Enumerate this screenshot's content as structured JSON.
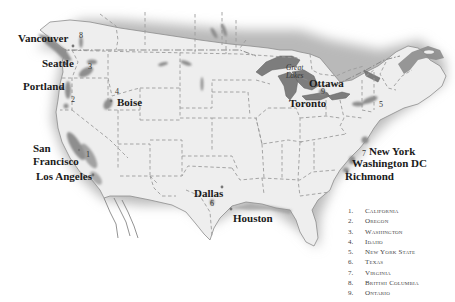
{
  "map": {
    "title": "Map of wine regions / cities of North America",
    "colors": {
      "land": "#efefef",
      "region": "#8a8a8a",
      "water": "#7a7a7a",
      "border": "#9a9a9a",
      "shadow": "#bdbdbd"
    }
  },
  "cities": [
    {
      "name": "Vancouver",
      "x": 18,
      "y": 35
    },
    {
      "name": "Seattle",
      "x": 42,
      "y": 60
    },
    {
      "name": "Portland",
      "x": 23,
      "y": 82
    },
    {
      "name": "Boise",
      "x": 117,
      "y": 97
    },
    {
      "name": "San Francisco",
      "line1": "San",
      "line2": "Francisco",
      "x": 33,
      "y": 142
    },
    {
      "name": "Los Angeles",
      "x": 36,
      "y": 171
    },
    {
      "name": "Dallas",
      "x": 194,
      "y": 189
    },
    {
      "name": "Houston",
      "x": 233,
      "y": 214
    },
    {
      "name": "Ottawa",
      "x": 308,
      "y": 78
    },
    {
      "name": "Toronto",
      "x": 288,
      "y": 98
    },
    {
      "name": "New York",
      "x": 369,
      "y": 146
    },
    {
      "name": "Washington DC",
      "x": 352,
      "y": 158
    },
    {
      "name": "Richmond",
      "x": 345,
      "y": 171
    }
  ],
  "region_numbers": [
    {
      "label": "1",
      "x": 86,
      "y": 151
    },
    {
      "label": "2",
      "x": 71,
      "y": 96
    },
    {
      "label": "3",
      "x": 88,
      "y": 64
    },
    {
      "label": "4",
      "x": 115,
      "y": 88
    },
    {
      "label": "5",
      "x": 379,
      "y": 101
    },
    {
      "label": "6",
      "x": 210,
      "y": 200
    },
    {
      "label": "7",
      "x": 362,
      "y": 150
    },
    {
      "label": "8",
      "x": 79,
      "y": 33
    },
    {
      "label": "9",
      "x": 321,
      "y": 89
    }
  ],
  "lake_label": {
    "line1": "Great",
    "line2": "Lakes",
    "x": 286,
    "y": 64
  },
  "legend": {
    "items": [
      {
        "num": "1.",
        "name": "California"
      },
      {
        "num": "2.",
        "name": "Oregon"
      },
      {
        "num": "3.",
        "name": "Washington"
      },
      {
        "num": "4.",
        "name": "Idaho"
      },
      {
        "num": "5.",
        "name": "New York State"
      },
      {
        "num": "6.",
        "name": "Texas"
      },
      {
        "num": "7.",
        "name": "Virginia"
      },
      {
        "num": "8.",
        "name": "British Columbia"
      },
      {
        "num": "9.",
        "name": "Ontario"
      }
    ]
  }
}
